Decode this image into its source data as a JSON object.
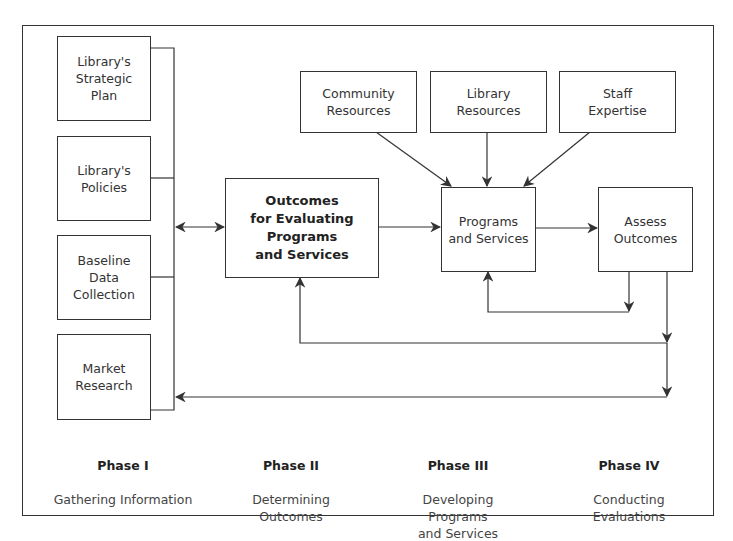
{
  "diagram": {
    "phase1_inputs": [
      {
        "label": "Library's\nStrategic\nPlan"
      },
      {
        "label": "Library's\nPolicies"
      },
      {
        "label": "Baseline\nData\nCollection"
      },
      {
        "label": "Market\nResearch"
      }
    ],
    "resources": [
      {
        "label": "Community\nResources"
      },
      {
        "label": "Library\nResources"
      },
      {
        "label": "Staff\nExpertise"
      }
    ],
    "outcomes_box": {
      "label": "Outcomes\nfor Evaluating\nPrograms\nand Services"
    },
    "programs_box": {
      "label": "Programs\nand Services"
    },
    "assess_box": {
      "label": "Assess\nOutcomes"
    },
    "phases": [
      {
        "title": "Phase I",
        "subtitle": "Gathering Information"
      },
      {
        "title": "Phase II",
        "subtitle": "Determining\nOutcomes"
      },
      {
        "title": "Phase III",
        "subtitle": "Developing\nPrograms\nand Services"
      },
      {
        "title": "Phase IV",
        "subtitle": "Conducting\nEvaluations"
      }
    ],
    "line_color": "#333333"
  }
}
